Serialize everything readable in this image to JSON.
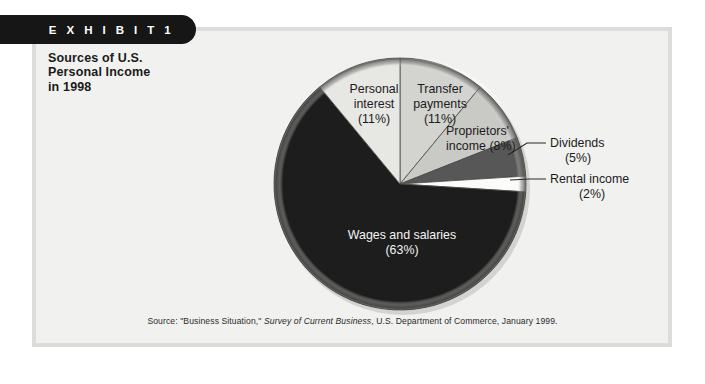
{
  "exhibit": {
    "tab_label": "E X H I B I T   1",
    "title_line1": "Sources of U.S.",
    "title_line2": "Personal Income",
    "title_line3": "in 1998"
  },
  "source": {
    "prefix": "Source: \"Business Situation,\" ",
    "italic": "Survey of Current Business",
    "suffix": ", U.S. Department of Commerce, January 1999."
  },
  "labels": {
    "wages_l1": "Wages and salaries",
    "wages_l2": "(63%)",
    "personal_l1": "Personal",
    "personal_l2": "interest",
    "personal_l3": "(11%)",
    "transfer_l1": "Transfer",
    "transfer_l2": "payments",
    "transfer_l3": "(11%)",
    "proprietors_l1": "Proprietors'",
    "proprietors_l2": "income (8%)",
    "dividends_l1": "Dividends",
    "dividends_l2": "(5%)",
    "rental_l1": "Rental income",
    "rental_l2": "(2%)"
  },
  "chart_data": {
    "type": "pie",
    "title": "Sources of U.S. Personal Income in 1998",
    "unit": "percent",
    "start_angle_deg": 0,
    "direction": "clockwise",
    "categories": [
      "Transfer payments",
      "Proprietors' income",
      "Dividends",
      "Rental income",
      "Wages and salaries",
      "Personal interest"
    ],
    "values": [
      11,
      8,
      5,
      2,
      63,
      11
    ],
    "slices": [
      {
        "name": "Transfer payments",
        "value": 11,
        "color": "#d3d3d0",
        "label_color": "#1c1c1c"
      },
      {
        "name": "Proprietors' income",
        "value": 8,
        "color": "#c9c9c6",
        "label_color": "#1c1c1c"
      },
      {
        "name": "Dividends",
        "value": 5,
        "color": "#575757",
        "label_color": "#1c1c1c"
      },
      {
        "name": "Rental income",
        "value": 2,
        "color": "#fbfbfa",
        "label_color": "#1c1c1c"
      },
      {
        "name": "Wages and salaries",
        "value": 63,
        "color": "#1d1d1d",
        "label_color": "#f4f4f4"
      },
      {
        "name": "Personal interest",
        "value": 11,
        "color": "#e7e7e4",
        "label_color": "#1c1c1c"
      }
    ],
    "legend_position": "none",
    "grid": false
  },
  "colors": {
    "panel_bg": "#f1f1ef",
    "panel_border": "#dcdcdb",
    "tab_bg": "#161616",
    "tab_text": "#ffffff",
    "text": "#1b1b1b"
  }
}
